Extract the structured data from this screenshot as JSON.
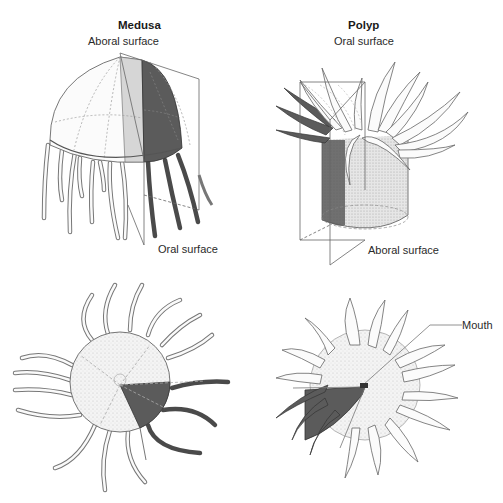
{
  "figure": {
    "panels": [
      {
        "id": "medusa",
        "title": "Medusa",
        "labels": {
          "top": "Aboral surface",
          "bottom": "Oral surface"
        }
      },
      {
        "id": "polyp",
        "title": "Polyp",
        "labels": {
          "top": "Oral surface",
          "bottom": "Aboral surface"
        }
      }
    ],
    "callouts": {
      "mouth": "Mouth"
    },
    "colors": {
      "outline": "#555555",
      "light_fill": "#f2f2f2",
      "mid_fill": "#c8c8c8",
      "dark_fill": "#5a5a5a",
      "background": "#ffffff"
    }
  }
}
